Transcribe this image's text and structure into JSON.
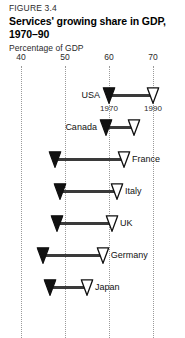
{
  "figure": {
    "number": "FIGURE 3.4",
    "title": "Services' growing share in GDP, 1970–90",
    "subtitle": "Percentage of GDP"
  },
  "annotations": {
    "start_year": "1970",
    "end_year": "1990"
  },
  "colors": {
    "connector": "#3a3a3a",
    "marker_start_fill": "#111111",
    "marker_end_fill": "#ffffff",
    "marker_stroke": "#111111",
    "gridline": "#9a9a9a",
    "text": "#1a1a1a"
  },
  "chart_data": {
    "type": "bar",
    "subtype": "dumbbell-range",
    "title": "Services' growing share in GDP, 1970–90",
    "subtitle": "Percentage of GDP",
    "xlabel": "Percentage of GDP",
    "ylabel": "",
    "xlim": [
      40,
      70
    ],
    "xticks": [
      40,
      50,
      60,
      70
    ],
    "xtick_labels": [
      "40",
      "50",
      "60",
      "70"
    ],
    "grid": true,
    "legend": "none",
    "categories": [
      "USA",
      "Canada",
      "France",
      "Italy",
      "UK",
      "Germany",
      "Japan"
    ],
    "label_side": [
      "left",
      "left",
      "right",
      "right",
      "right",
      "right",
      "right"
    ],
    "series": [
      {
        "name": "1970",
        "marker": "filled-triangle",
        "values": [
          60.0,
          59.3,
          47.7,
          48.9,
          48.2,
          45.0,
          46.6
        ]
      },
      {
        "name": "1990",
        "marker": "hollow-triangle",
        "values": [
          70.0,
          65.6,
          63.4,
          61.8,
          60.7,
          58.6,
          55.0
        ]
      }
    ],
    "points": [
      {
        "label": "USA",
        "start": 60.0,
        "end": 70.0,
        "label_side": "left"
      },
      {
        "label": "Canada",
        "start": 59.3,
        "end": 65.6,
        "label_side": "left"
      },
      {
        "label": "France",
        "start": 47.7,
        "end": 63.4,
        "label_side": "right"
      },
      {
        "label": "Italy",
        "start": 48.9,
        "end": 61.8,
        "label_side": "right"
      },
      {
        "label": "UK",
        "start": 48.2,
        "end": 60.7,
        "label_side": "right"
      },
      {
        "label": "Germany",
        "start": 45.0,
        "end": 58.6,
        "label_side": "right"
      },
      {
        "label": "Japan",
        "start": 46.6,
        "end": 55.0,
        "label_side": "right"
      }
    ]
  }
}
